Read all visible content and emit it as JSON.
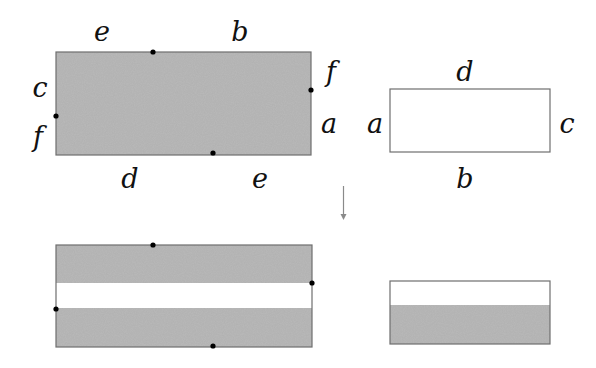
{
  "colors": {
    "gray_fill": "#b9b9b9",
    "white_fill": "#ffffff",
    "border": "#6e6e6e",
    "dot": "#000000",
    "label": "#111111",
    "arrow": "#8a8a8a"
  },
  "top_left_rectangle": {
    "fill": "gray",
    "labels": {
      "top_left": "e",
      "top_right": "b",
      "left_upper": "c",
      "left_lower": "f",
      "right_upper": "f",
      "right_lower": "a",
      "bottom_left": "d",
      "bottom_right": "e"
    },
    "marked_points": [
      "top-edge",
      "right-edge",
      "left-edge",
      "bottom-edge"
    ]
  },
  "top_right_rectangle": {
    "fill": "white",
    "labels": {
      "top": "d",
      "left": "a",
      "right": "c",
      "bottom": "b"
    }
  },
  "arrow": {
    "direction": "down"
  },
  "bottom_left_rectangle": {
    "bands": [
      "gray",
      "white",
      "gray"
    ],
    "marked_points": [
      "top-edge",
      "right-edge",
      "left-edge",
      "bottom-edge"
    ]
  },
  "bottom_right_rectangle": {
    "bands": [
      "white",
      "gray"
    ]
  }
}
